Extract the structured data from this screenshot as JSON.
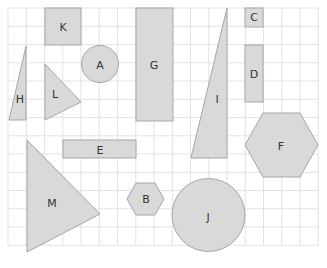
{
  "diagram": {
    "grid": {
      "x0": 8,
      "y0": 8,
      "cell": 18.25,
      "cols": 17,
      "rows": 13,
      "color": "#dcdcdc"
    },
    "fill_color": "#d9d9d9",
    "stroke_color": "#a6a6a6",
    "shapes": [
      {
        "label": "K",
        "type": "rectangle"
      },
      {
        "label": "A",
        "type": "circle"
      },
      {
        "label": "G",
        "type": "rectangle"
      },
      {
        "label": "C",
        "type": "square"
      },
      {
        "label": "D",
        "type": "rectangle"
      },
      {
        "label": "H",
        "type": "triangle"
      },
      {
        "label": "L",
        "type": "triangle"
      },
      {
        "label": "I",
        "type": "triangle"
      },
      {
        "label": "F",
        "type": "hexagon"
      },
      {
        "label": "E",
        "type": "rectangle"
      },
      {
        "label": "M",
        "type": "triangle"
      },
      {
        "label": "B",
        "type": "hexagon"
      },
      {
        "label": "J",
        "type": "circle"
      }
    ]
  }
}
